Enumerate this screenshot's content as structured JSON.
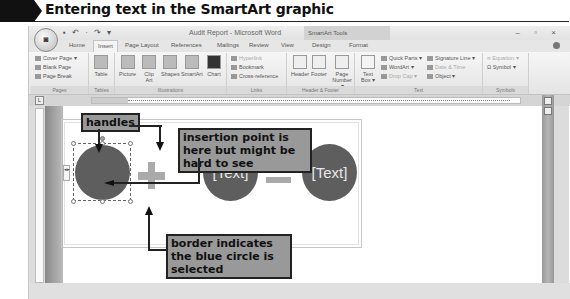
{
  "figure": {
    "title": "Entering text in the SmartArt graphic"
  },
  "window": {
    "office_button": "Office",
    "quick_access": "▪ ↶ · ↷ ▾",
    "title": "Audit Report - Microsoft Word",
    "contextual_tab": "SmartArt Tools",
    "controls": "– ▫ ×"
  },
  "tabs": [
    {
      "label": "Home"
    },
    {
      "label": "Insert"
    },
    {
      "label": "Page Layout"
    },
    {
      "label": "References"
    },
    {
      "label": "Mailings"
    },
    {
      "label": "Review"
    },
    {
      "label": "View"
    },
    {
      "label": "Design"
    },
    {
      "label": "Format"
    }
  ],
  "ribbon": {
    "pages": {
      "label": "Pages",
      "items": [
        "Cover Page ▾",
        "Blank Page",
        "Page Break"
      ]
    },
    "tables": {
      "label": "Tables",
      "items": [
        "Table"
      ]
    },
    "illustrations": {
      "label": "Illustrations",
      "items": [
        "Picture",
        "Clip Art",
        "Shapes",
        "SmartArt",
        "Chart"
      ]
    },
    "links": {
      "label": "Links",
      "items": [
        "Hyperlink",
        "Bookmark",
        "Cross-reference"
      ]
    },
    "header_footer": {
      "label": "Header & Footer",
      "items": [
        "Header",
        "Footer",
        "Page Number ▾"
      ]
    },
    "text": {
      "label": "Text",
      "items": [
        "Text Box ▾",
        "Quick Parts ▾",
        "WordArt ▾",
        "Drop Cap ▾",
        "Signature Line ▾",
        "Date & Time",
        "Object ▾"
      ]
    },
    "symbols": {
      "label": "Symbols",
      "items": [
        "Equation ▾",
        "Symbol ▾"
      ]
    }
  },
  "ruler": {
    "corner": "L"
  },
  "smartart": {
    "shapes": [
      {
        "text": "",
        "selected": true
      },
      {
        "text": "[Text]"
      },
      {
        "text": "[Text]"
      }
    ],
    "panel_tab": "◂▸"
  },
  "callouts": {
    "handles": "handles",
    "insertion": "insertion point is here but might be hard to see",
    "border": "border indicates the blue circle is selected"
  }
}
